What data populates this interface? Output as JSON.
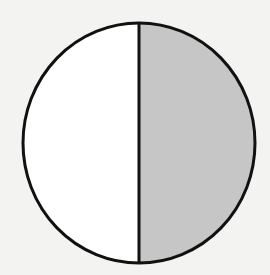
{
  "diagram": {
    "type": "fraction-circle",
    "shape": "circle",
    "parts": 2,
    "shaded_parts": 1,
    "shaded_side": "right",
    "divider": "vertical",
    "colors": {
      "background": "#f3f3f1",
      "unshaded_fill": "#ffffff",
      "shaded_fill": "#c6c6c6",
      "outline": "#111111"
    }
  }
}
